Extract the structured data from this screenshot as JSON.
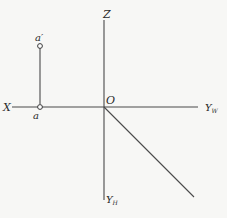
{
  "diagram": {
    "type": "orthographic-projection-axes",
    "colors": {
      "background": "#f7f7f5",
      "line": "#4a4a4a",
      "text": "#2a2a2a"
    },
    "labels": {
      "z": "Z",
      "x": "X",
      "o": "O",
      "yw_base": "Y",
      "yw_sub": "W",
      "yh_base": "Y",
      "yh_sub": "H",
      "a_prime": "a′",
      "a": "a"
    }
  }
}
